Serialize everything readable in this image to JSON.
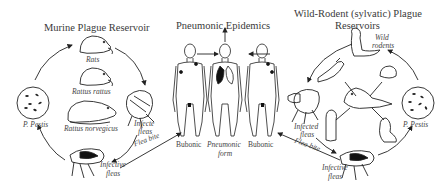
{
  "sections": {
    "murine": {
      "title": "Murine Plague Reservoir",
      "rats": "Rats",
      "rattus_rattus": "Rattus rattus",
      "rattus_norvegicus": "Rattus norvegicus",
      "pestis": "P. Pestis",
      "infected_fleas_1": "Infecte",
      "infected_fleas_2": "fleas",
      "flea_bite": "Flea bite",
      "infective_fleas_1": "Infective",
      "infective_fleas_2": "fleas"
    },
    "pneumonic": {
      "title": "Pneumonic Epidemics",
      "bubonic_left": "Bubonic",
      "pneumonic_form_1": "Pneumonic",
      "pneumonic_form_2": "form",
      "bubonic_right": "Bubonic"
    },
    "sylvatic": {
      "title_line1": "Wild-Rodent (sylvatic) Plague",
      "title_line2": "Reservoirs",
      "wild_rodents_1": "Wild",
      "wild_rodents_2": "rodents",
      "pestis": "P. Pestis",
      "infected_fleas_1": "Infected",
      "infected_fleas_2": "fleas",
      "flea_bite": "Flea bite",
      "infective_fleas_1": "Infective",
      "infective_fleas_2": "fleas"
    }
  },
  "colors": {
    "line": "#222222",
    "text": "#3a3a3a",
    "fill_dark": "#111111"
  }
}
